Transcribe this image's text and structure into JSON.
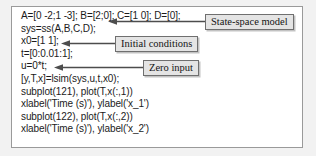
{
  "figure": {
    "type": "matlab-code-listing-with-callouts",
    "background_color": "#f2f2f2",
    "panel_border_color": "#9a9a9a",
    "callout_fill_color": "#e4e4e4",
    "callout_border_color": "#6f6f6f",
    "text_color": "#1b1b1b"
  },
  "code": {
    "lines": [
      "A=[0 -2;1 -3]; B=[2;0]; C=[1 0]; D=[0];",
      "sys=ss(A,B,C,D);",
      "x0=[1 1];",
      "t=[0:0.01:1];",
      "u=0*t;",
      "[y,T,x]=lsim(sys,u,t,x0);",
      "subplot(121), plot(T,x(:,1))",
      "xlabel('Time (s)'), ylabel('x_1')",
      "subplot(122), plot(T,x(:,2))",
      "xlabel('Time (s)'), ylabel('x_2')"
    ]
  },
  "callouts": [
    {
      "id": "state-space",
      "label": "State-space model",
      "points_to_line": "sys=ss(A,B,C,D);"
    },
    {
      "id": "initial-conditions",
      "label": "Initial conditions",
      "points_to_line": "x0=[1 1];"
    },
    {
      "id": "zero-input",
      "label": "Zero input",
      "points_to_line": "u=0*t;"
    }
  ]
}
